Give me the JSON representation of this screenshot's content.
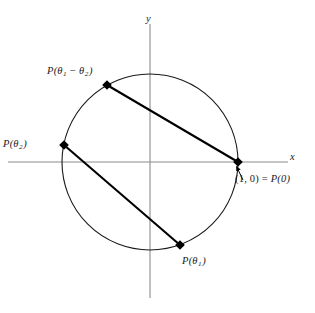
{
  "figure": {
    "background_color": "#ffffff",
    "axis_color": "#808080",
    "curve_color": "#1a1a1a",
    "chord_color": "#000000",
    "point_color": "#000000"
  },
  "axes": {
    "x_label": "x",
    "y_label": "y",
    "origin": {
      "x": 150,
      "y": 162
    }
  },
  "circle": {
    "center_x": 150,
    "center_y": 162,
    "radius": 88
  },
  "points": [
    {
      "id": "p0",
      "label_prefix": "P",
      "label_open": "(",
      "label_arg": "0",
      "label_close": ")",
      "annotation": "(1, 0) = P(0)",
      "annotation_coord": "(1, 0)",
      "annotation_eq": "=",
      "annotation_func": "P(0)",
      "x": 238,
      "y": 162,
      "angle_deg": 0
    },
    {
      "id": "p-theta1",
      "label_prefix": "P",
      "label_open": "(",
      "label_greek": "θ",
      "label_sub": "1",
      "label_close": ")",
      "x": 180,
      "y": 245,
      "angle_deg": -70
    },
    {
      "id": "p-theta2",
      "label_prefix": "P",
      "label_open": "(",
      "label_greek": "θ",
      "label_sub": "2",
      "label_close": ")",
      "x": 64,
      "y": 145,
      "angle_deg": 169
    },
    {
      "id": "p-theta1-minus-theta2",
      "label_prefix": "P",
      "label_open": "(",
      "label_greek1": "θ",
      "label_sub1": "1",
      "label_minus": "−",
      "label_greek2": "θ",
      "label_sub2": "2",
      "label_close": ")",
      "x": 107,
      "y": 85,
      "angle_deg": 119
    }
  ],
  "chords": [
    {
      "id": "chord-p0-to-p-theta1-minus-theta2",
      "from": "p0",
      "to": "p-theta1-minus-theta2"
    },
    {
      "id": "chord-p-theta2-to-p-theta1",
      "from": "p-theta2",
      "to": "p-theta1"
    }
  ],
  "leader": {
    "id": "leader-arrow-to-p0",
    "from_x": 243,
    "from_y": 180,
    "to_x": 236,
    "to_y": 166
  }
}
